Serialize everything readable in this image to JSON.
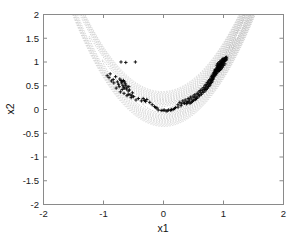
{
  "figure": {
    "background_color": "#ffffff",
    "axis_color": "#8a8a8a",
    "contour_color": "#b9b9b9",
    "marker_color": "#050505",
    "plot_box": {
      "left": 43,
      "top": 14,
      "right": 283,
      "bottom": 204
    }
  },
  "axes": {
    "xlabel": "x1",
    "ylabel": "x2",
    "xlim": [
      -2,
      2
    ],
    "ylim": [
      -2,
      2
    ],
    "xticks": [
      -2,
      -1,
      0,
      1,
      2
    ],
    "xticklabels": [
      "-2",
      "-1",
      "0",
      "1",
      "2"
    ],
    "yticks": [
      -2,
      -1.5,
      -1,
      -0.5,
      0,
      0.5,
      1,
      1.5,
      2
    ],
    "yticklabels": [
      "-2",
      "-1.5",
      "-1",
      "-0.5",
      "0",
      "0.5",
      "1",
      "1.5",
      "2"
    ],
    "grid": false,
    "minor_xticks": [
      -1.5,
      -0.5,
      0.5,
      1.5
    ]
  },
  "chart_data": {
    "type": "scatter",
    "title": "",
    "xlabel": "x1",
    "ylabel": "x2",
    "xlim": [
      -2,
      2
    ],
    "ylim": [
      -2,
      2
    ],
    "grid": false,
    "legend": null,
    "marker": "plus",
    "marker_color": "#050505",
    "background_contours": {
      "type": "contour",
      "function": "rosenbrock",
      "description": "nested parabolic dotted contour lines of f(x1,x2) = (1-x1)^2 + 100*(x2-x1^2)^2 style valley, vertex family along x2 = x1^2",
      "style": "dotted",
      "color": "#b9b9b9",
      "levels": [
        0.05,
        0.2,
        0.45,
        0.8,
        1.25,
        1.8,
        2.45,
        3.2,
        4.05,
        5.0,
        6.05,
        7.2,
        8.45,
        9.8,
        11.25,
        12.8,
        14.45
      ]
    },
    "points": [
      [
        -0.93,
        0.7
      ],
      [
        -0.9,
        0.66
      ],
      [
        -0.88,
        0.74
      ],
      [
        -0.86,
        0.59
      ],
      [
        -0.83,
        0.62
      ],
      [
        -0.82,
        0.55
      ],
      [
        -0.79,
        0.68
      ],
      [
        -0.78,
        0.44
      ],
      [
        -0.76,
        0.57
      ],
      [
        -0.74,
        0.52
      ],
      [
        -0.73,
        0.47
      ],
      [
        -0.72,
        0.63
      ],
      [
        -0.71,
        0.36
      ],
      [
        -0.7,
        0.99
      ],
      [
        -0.69,
        0.55
      ],
      [
        -0.68,
        0.41
      ],
      [
        -0.67,
        0.5
      ],
      [
        -0.66,
        0.46
      ],
      [
        -0.65,
        0.33
      ],
      [
        -0.63,
        0.53
      ],
      [
        -0.62,
        0.98
      ],
      [
        -0.61,
        0.42
      ],
      [
        -0.6,
        0.28
      ],
      [
        -0.58,
        0.38
      ],
      [
        -0.57,
        0.47
      ],
      [
        -0.55,
        0.3
      ],
      [
        -0.53,
        0.24
      ],
      [
        -0.51,
        0.34
      ],
      [
        -0.46,
        0.99
      ],
      [
        -0.45,
        0.19
      ],
      [
        -0.41,
        0.22
      ],
      [
        -0.36,
        0.17
      ],
      [
        -0.31,
        0.18
      ],
      [
        -0.27,
        0.2
      ],
      [
        -0.22,
        0.14
      ],
      [
        -0.18,
        0.09
      ],
      [
        -0.14,
        0.05
      ],
      [
        -0.12,
        0.03
      ],
      [
        -0.1,
        0.02
      ],
      [
        -0.08,
        -0.02
      ],
      [
        -0.03,
        -0.03
      ],
      [
        0.0,
        -0.03
      ],
      [
        0.02,
        -0.02
      ],
      [
        0.05,
        -0.04
      ],
      [
        0.09,
        -0.02
      ],
      [
        0.13,
        -0.03
      ],
      [
        0.17,
        -0.01
      ],
      [
        0.21,
        0.03
      ],
      [
        0.25,
        0.09
      ],
      [
        0.28,
        0.14
      ],
      [
        0.31,
        0.11
      ],
      [
        0.33,
        0.17
      ],
      [
        0.35,
        0.13
      ],
      [
        0.37,
        0.19
      ],
      [
        0.4,
        0.16
      ],
      [
        0.42,
        0.22
      ],
      [
        0.44,
        0.19
      ],
      [
        0.46,
        0.25
      ],
      [
        0.48,
        0.21
      ],
      [
        0.5,
        0.27
      ],
      [
        0.52,
        0.24
      ],
      [
        0.53,
        0.3
      ],
      [
        0.55,
        0.27
      ],
      [
        0.57,
        0.33
      ],
      [
        0.59,
        0.3
      ],
      [
        0.6,
        0.36
      ],
      [
        0.62,
        0.39
      ],
      [
        0.63,
        0.34
      ],
      [
        0.65,
        0.42
      ],
      [
        0.66,
        0.38
      ],
      [
        0.68,
        0.45
      ],
      [
        0.69,
        0.41
      ],
      [
        0.7,
        0.49
      ],
      [
        0.71,
        0.44
      ],
      [
        0.72,
        0.52
      ],
      [
        0.73,
        0.48
      ],
      [
        0.74,
        0.56
      ],
      [
        0.75,
        0.51
      ],
      [
        0.76,
        0.59
      ],
      [
        0.77,
        0.54
      ],
      [
        0.78,
        0.62
      ],
      [
        0.79,
        0.57
      ],
      [
        0.8,
        0.65
      ],
      [
        0.8,
        0.6
      ],
      [
        0.81,
        0.68
      ],
      [
        0.82,
        0.63
      ],
      [
        0.82,
        0.71
      ],
      [
        0.83,
        0.66
      ],
      [
        0.84,
        0.74
      ],
      [
        0.84,
        0.69
      ],
      [
        0.85,
        0.77
      ],
      [
        0.85,
        0.72
      ],
      [
        0.86,
        0.8
      ],
      [
        0.86,
        0.75
      ],
      [
        0.87,
        0.78
      ],
      [
        0.87,
        0.83
      ],
      [
        0.88,
        0.81
      ],
      [
        0.88,
        0.76
      ],
      [
        0.89,
        0.84
      ],
      [
        0.89,
        0.79
      ],
      [
        0.9,
        0.87
      ],
      [
        0.9,
        0.82
      ],
      [
        0.91,
        0.85
      ],
      [
        0.91,
        0.9
      ],
      [
        0.92,
        0.88
      ],
      [
        0.92,
        0.83
      ],
      [
        0.93,
        0.91
      ],
      [
        0.93,
        0.86
      ],
      [
        0.94,
        0.94
      ],
      [
        0.94,
        0.89
      ],
      [
        0.95,
        0.92
      ],
      [
        0.95,
        0.87
      ],
      [
        0.96,
        0.95
      ],
      [
        0.96,
        0.9
      ],
      [
        0.97,
        0.98
      ],
      [
        0.97,
        0.93
      ],
      [
        0.98,
        0.96
      ],
      [
        0.98,
        0.91
      ],
      [
        0.99,
        0.99
      ],
      [
        0.99,
        0.94
      ],
      [
        1.0,
        1.01
      ],
      [
        1.0,
        0.97
      ],
      [
        1.01,
        1.03
      ],
      [
        1.01,
        0.99
      ],
      [
        1.02,
        1.05
      ],
      [
        1.02,
        1.0
      ],
      [
        1.03,
        1.06
      ],
      [
        1.03,
        1.02
      ],
      [
        1.04,
        1.08
      ],
      [
        1.04,
        1.04
      ],
      [
        1.05,
        1.07
      ],
      [
        1.05,
        1.03
      ],
      [
        1.06,
        1.09
      ],
      [
        1.06,
        1.05
      ],
      [
        0.88,
        0.72
      ],
      [
        0.89,
        0.75
      ],
      [
        0.9,
        0.78
      ],
      [
        0.91,
        0.81
      ],
      [
        0.92,
        0.79
      ],
      [
        0.93,
        0.82
      ],
      [
        0.85,
        0.68
      ],
      [
        0.86,
        0.71
      ],
      [
        0.87,
        0.74
      ],
      [
        0.84,
        0.65
      ],
      [
        0.83,
        0.62
      ],
      [
        0.82,
        0.59
      ],
      [
        0.81,
        0.56
      ],
      [
        0.79,
        0.53
      ],
      [
        0.78,
        0.5
      ],
      [
        0.76,
        0.47
      ],
      [
        0.74,
        0.44
      ],
      [
        0.72,
        0.41
      ],
      [
        0.7,
        0.38
      ],
      [
        0.67,
        0.35
      ],
      [
        0.64,
        0.31
      ],
      [
        0.61,
        0.28
      ],
      [
        0.58,
        0.25
      ],
      [
        0.56,
        0.22
      ],
      [
        0.54,
        0.2
      ],
      [
        0.51,
        0.18
      ],
      [
        0.49,
        0.16
      ],
      [
        0.47,
        0.14
      ],
      [
        0.45,
        0.12
      ],
      [
        0.43,
        0.15
      ],
      [
        0.41,
        0.13
      ],
      [
        0.39,
        0.11
      ],
      [
        0.36,
        0.12
      ],
      [
        0.3,
        0.07
      ],
      [
        0.25,
        0.04
      ],
      [
        0.19,
        0.01
      ],
      [
        0.14,
        -0.01
      ],
      [
        0.07,
        -0.04
      ],
      [
        0.95,
        0.84
      ],
      [
        0.97,
        0.86
      ],
      [
        0.99,
        0.88
      ],
      [
        1.01,
        0.92
      ],
      [
        1.03,
        0.95
      ],
      [
        0.94,
        0.81
      ],
      [
        0.96,
        0.83
      ],
      [
        0.92,
        0.86
      ],
      [
        0.9,
        0.92
      ],
      [
        0.91,
        0.95
      ],
      [
        0.93,
        0.97
      ],
      [
        0.95,
        1.0
      ],
      [
        0.97,
        1.02
      ],
      [
        0.99,
        1.04
      ],
      [
        1.0,
        1.06
      ],
      [
        -0.7,
        0.6
      ],
      [
        -0.68,
        0.58
      ],
      [
        -0.66,
        0.6
      ],
      [
        -0.64,
        0.57
      ],
      [
        -0.62,
        0.5
      ],
      [
        -0.64,
        0.44
      ],
      [
        -0.6,
        0.46
      ],
      [
        -0.58,
        0.31
      ],
      [
        -0.56,
        0.4
      ],
      [
        -0.52,
        0.28
      ],
      [
        -0.49,
        0.26
      ],
      [
        -0.33,
        0.22
      ],
      [
        -0.29,
        0.16
      ]
    ]
  }
}
